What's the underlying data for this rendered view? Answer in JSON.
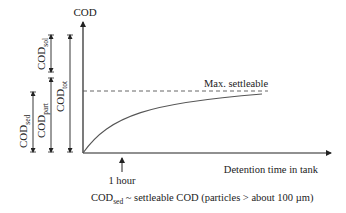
{
  "diagram": {
    "y_axis_label": "COD",
    "x_axis_label": "Detention time in tank",
    "max_line_label": "Max. settleable",
    "tick_label": "1 hour",
    "brackets": {
      "sed": {
        "base": "COD",
        "sub": "sed"
      },
      "part": {
        "base": "COD",
        "sub": "part"
      },
      "sol": {
        "base": "COD",
        "sub": "sol"
      },
      "tot": {
        "base": "COD",
        "sub": "tot"
      }
    },
    "caption": {
      "base": "COD",
      "sub": "sed",
      "rest": " ~ settleable COD (particles > about 100 µm)"
    },
    "colors": {
      "line": "#222222",
      "curve": "#555555",
      "dash": "#555555"
    }
  }
}
